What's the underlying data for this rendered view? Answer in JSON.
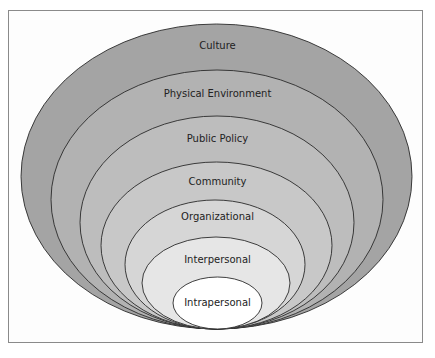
{
  "diagram": {
    "type": "nested-ellipses",
    "layers": [
      {
        "label": "Culture",
        "color": "#a4a4a4",
        "top": 24,
        "left": 21,
        "right": 412,
        "label_y": 40
      },
      {
        "label": "Physical Environment",
        "color": "#b2b2b2",
        "top": 70,
        "left": 51,
        "right": 383,
        "label_y": 88
      },
      {
        "label": "Public Policy",
        "color": "#bdbdbd",
        "top": 116,
        "left": 80,
        "right": 354,
        "label_y": 133
      },
      {
        "label": "Community",
        "color": "#c8c8c8",
        "top": 162,
        "left": 101,
        "right": 332,
        "label_y": 176
      },
      {
        "label": "Organizational",
        "color": "#d6d6d6",
        "top": 200,
        "left": 125,
        "right": 305,
        "label_y": 211
      },
      {
        "label": "Interpersonal",
        "color": "#e6e6e6",
        "top": 237,
        "left": 142,
        "right": 290,
        "label_y": 254
      },
      {
        "label": "Intrapersonal",
        "color": "#ffffff",
        "top": 277,
        "left": 173,
        "right": 262,
        "label_y": 297
      }
    ],
    "bottom_y": 329
  }
}
